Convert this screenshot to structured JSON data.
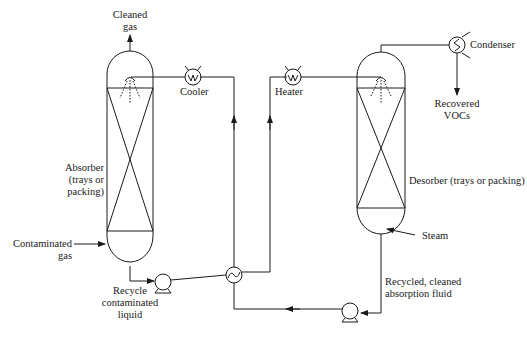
{
  "colors": {
    "line": "#1a1a1a",
    "background": "#ffffff"
  },
  "labels": {
    "cleaned_gas": [
      "Cleaned",
      "gas"
    ],
    "cooler": "Cooler",
    "heater": "Heater",
    "condenser": "Condenser",
    "recovered_vocs": [
      "Recovered",
      "VOCs"
    ],
    "absorber": [
      "Absorber",
      "(trays or",
      "packing)"
    ],
    "desorber": "Desorber (trays or packing)",
    "contaminated_gas": [
      "Contaminated",
      "gas"
    ],
    "steam": "Steam",
    "recycle_contaminated_liquid": [
      "Recycle",
      "contaminated",
      "liquid"
    ],
    "recycled_cleaned_fluid": [
      "Recycled, cleaned",
      "absorption fluid"
    ]
  },
  "components": [
    {
      "id": "absorber",
      "type": "column",
      "icon": "column-icon"
    },
    {
      "id": "desorber",
      "type": "column",
      "icon": "column-icon"
    },
    {
      "id": "cooler",
      "type": "heat-exchanger",
      "icon": "cooler-icon"
    },
    {
      "id": "heater",
      "type": "heat-exchanger",
      "icon": "heater-icon"
    },
    {
      "id": "condenser",
      "type": "heat-exchanger",
      "icon": "condenser-icon"
    },
    {
      "id": "cross-exchanger",
      "type": "heat-exchanger",
      "icon": "cross-exchanger-icon"
    },
    {
      "id": "pump-1",
      "type": "pump",
      "icon": "pump-icon"
    },
    {
      "id": "pump-2",
      "type": "pump",
      "icon": "pump-icon"
    }
  ]
}
